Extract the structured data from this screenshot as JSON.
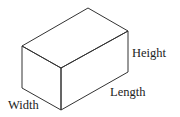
{
  "diagram": {
    "type": "rectangular-prism",
    "stroke_color": "#333333",
    "background": "#ffffff",
    "vertices": {
      "top_back": [
        88,
        8
      ],
      "top_right": [
        128,
        31
      ],
      "top_left": [
        22,
        46
      ],
      "top_front": [
        61,
        68
      ],
      "bottom_left": [
        22,
        88
      ],
      "bottom_front": [
        61,
        110
      ],
      "bottom_right": [
        128,
        72
      ]
    },
    "labels": {
      "height": "Height",
      "length": "Length",
      "width": "Width"
    }
  }
}
